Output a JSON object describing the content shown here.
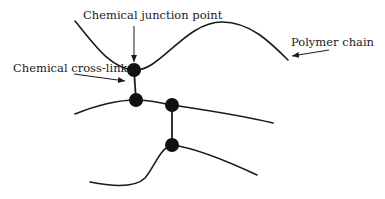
{
  "diagram": {
    "labels": {
      "junction": "Chemical junction point",
      "crosslinks": "Chemical cross-links",
      "chain": "Polymer chain"
    },
    "colors": {
      "line": "#1a1a1a",
      "node": "#111111",
      "background": "#ffffff"
    },
    "nodes": [
      {
        "id": "junction-top",
        "x": 134,
        "y": 70
      },
      {
        "id": "junction-mid-left",
        "x": 136,
        "y": 100
      },
      {
        "id": "junction-mid-right",
        "x": 172,
        "y": 105
      },
      {
        "id": "junction-bottom",
        "x": 172,
        "y": 145
      }
    ],
    "chains": 3,
    "crosslinks": 2
  }
}
